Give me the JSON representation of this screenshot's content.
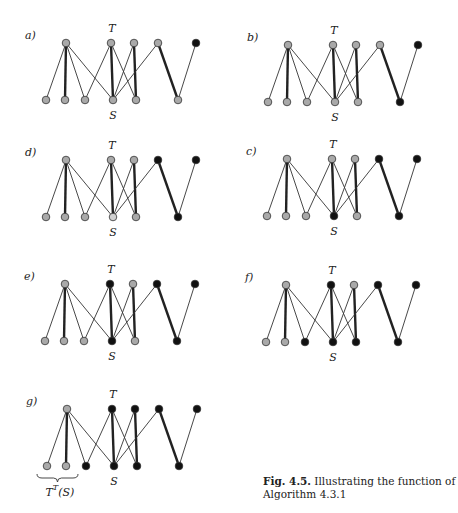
{
  "figure": {
    "caption_number": "Fig. 4.5.",
    "caption_text": " Illustrating the function of Algorithm 4.3.1",
    "colors": {
      "gray": "#a9a9a9",
      "black": "#111111",
      "faded": "#d0d0d0",
      "edge": "#333333"
    },
    "top_set_label": "T",
    "bottom_set_label": "S",
    "bracket_label": "T",
    "bracket_label_sup": "T",
    "bracket_label_tail": "(S)",
    "graph": {
      "top_x": [
        0,
        45,
        68,
        92,
        130
      ],
      "bottom_x": [
        -20,
        -1,
        19,
        47,
        70,
        112
      ],
      "height": 57,
      "edges": [
        {
          "t": 0,
          "b": 0,
          "w": "thin"
        },
        {
          "t": 0,
          "b": 1,
          "w": "thick"
        },
        {
          "t": 0,
          "b": 2,
          "w": "thin"
        },
        {
          "t": 0,
          "b": 3,
          "w": "thin"
        },
        {
          "t": 1,
          "b": 2,
          "w": "thin"
        },
        {
          "t": 1,
          "b": 3,
          "w": "thick"
        },
        {
          "t": 1,
          "b": 4,
          "w": "thin"
        },
        {
          "t": 2,
          "b": 3,
          "w": "thin"
        },
        {
          "t": 2,
          "b": 4,
          "w": "thick"
        },
        {
          "t": 3,
          "b": 3,
          "w": "thin"
        },
        {
          "t": 3,
          "b": 5,
          "w": "thick"
        },
        {
          "t": 4,
          "b": 5,
          "w": "thin"
        }
      ]
    },
    "panels": [
      {
        "label": "a)",
        "ox": 66,
        "oy": 43,
        "top": [
          "g",
          "g",
          "g",
          "g",
          "k"
        ],
        "bottom": [
          "g",
          "g",
          "g",
          "g",
          "g",
          "g"
        ],
        "bracket": false
      },
      {
        "label": "b)",
        "ox": 288,
        "oy": 45,
        "top": [
          "g",
          "g",
          "g",
          "g",
          "k"
        ],
        "bottom": [
          "g",
          "g",
          "g",
          "g",
          "g",
          "k"
        ],
        "bracket": false
      },
      {
        "label": "d)",
        "ox": 66,
        "oy": 160,
        "top": [
          "g",
          "g",
          "g",
          "k",
          "k"
        ],
        "bottom": [
          "g",
          "g",
          "g",
          "f",
          "g",
          "k"
        ],
        "bracket": false
      },
      {
        "label": "c)",
        "ox": 287,
        "oy": 159,
        "top": [
          "g",
          "g",
          "g",
          "k",
          "k"
        ],
        "bottom": [
          "g",
          "g",
          "g",
          "k",
          "g",
          "k"
        ],
        "bracket": false
      },
      {
        "label": "e)",
        "ox": 65,
        "oy": 284,
        "top": [
          "g",
          "k",
          "g",
          "k",
          "k"
        ],
        "bottom": [
          "g",
          "g",
          "g",
          "k",
          "g",
          "k"
        ],
        "bracket": false
      },
      {
        "label": "f)",
        "ox": 286,
        "oy": 285,
        "top": [
          "g",
          "k",
          "g",
          "k",
          "k"
        ],
        "bottom": [
          "g",
          "g",
          "k",
          "k",
          "k",
          "k"
        ],
        "bracket": false
      },
      {
        "label": "g)",
        "ox": 67,
        "oy": 409,
        "top": [
          "g",
          "k",
          "k",
          "k",
          "k"
        ],
        "bottom": [
          "g",
          "g",
          "k",
          "k",
          "k",
          "k"
        ],
        "bracket": true
      }
    ]
  }
}
